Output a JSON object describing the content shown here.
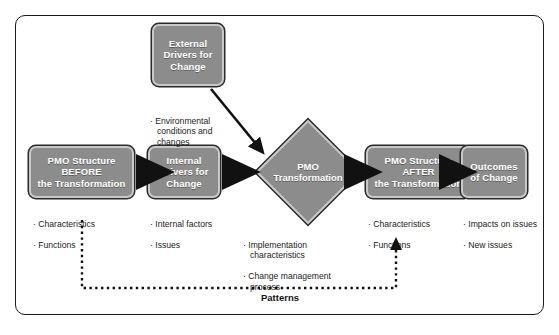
{
  "diagram": {
    "caption": "Patterns",
    "colors": {
      "node_fill": "#8c8c8c",
      "node_inner_border": "#c9c9c9",
      "node_outer_border": "#2b2b2b",
      "node_text": "#ffffff",
      "frame_border": "#1a1a1a",
      "body_text": "#1b1b1b",
      "arrow": "#111111"
    },
    "nodes": [
      {
        "id": "external-drivers",
        "shape": "rounded-rect",
        "label": "External\nDrivers for\nChange"
      },
      {
        "id": "pmo-before",
        "shape": "rounded-rect",
        "label": "PMO Structure\nBEFORE\nthe Transformation"
      },
      {
        "id": "internal-drivers",
        "shape": "rounded-rect",
        "label": "Internal\nDrivers for\nChange"
      },
      {
        "id": "pmo-transformation",
        "shape": "diamond",
        "label": "PMO\nTransformation"
      },
      {
        "id": "pmo-after",
        "shape": "rounded-rect",
        "label": "PMO Structure\nAFTER\nthe Transformation"
      },
      {
        "id": "outcomes",
        "shape": "rounded-rect",
        "label": "Outcomes\nof Change"
      }
    ],
    "bullet_groups": [
      {
        "id": "external-drivers-bullets",
        "for": "external-drivers",
        "items": [
          "Environmental\nconditions and\nchanges"
        ]
      },
      {
        "id": "pmo-before-bullets",
        "for": "pmo-before",
        "items": [
          "Characteristics",
          "Functions"
        ]
      },
      {
        "id": "internal-drivers-bullets",
        "for": "internal-drivers",
        "items": [
          "Internal factors",
          "Issues"
        ]
      },
      {
        "id": "pmo-transformation-bullets",
        "for": "pmo-transformation",
        "items": [
          "Implementation\ncharacteristics",
          "Change management\nprocess"
        ]
      },
      {
        "id": "pmo-after-bullets",
        "for": "pmo-after",
        "items": [
          "Characteristics",
          "Functions"
        ]
      },
      {
        "id": "outcomes-bullets",
        "for": "outcomes",
        "items": [
          "Impacts on issues",
          "New issues"
        ]
      }
    ],
    "connectors": [
      {
        "id": "external-to-transformation",
        "from": "external-drivers",
        "to": "pmo-transformation",
        "style": "solid-arrow"
      },
      {
        "id": "before-to-internal",
        "from": "pmo-before",
        "to": "internal-drivers",
        "style": "solid-arrow"
      },
      {
        "id": "internal-to-transformation",
        "from": "internal-drivers",
        "to": "pmo-transformation",
        "style": "solid-arrow"
      },
      {
        "id": "transformation-to-after",
        "from": "pmo-transformation",
        "to": "pmo-after",
        "style": "solid-arrow"
      },
      {
        "id": "after-to-outcomes",
        "from": "pmo-after",
        "to": "outcomes",
        "style": "solid-arrow"
      },
      {
        "id": "patterns-feedback",
        "from": "pmo-before",
        "to": "pmo-after",
        "style": "dotted-arrow",
        "label": "Patterns"
      }
    ]
  }
}
